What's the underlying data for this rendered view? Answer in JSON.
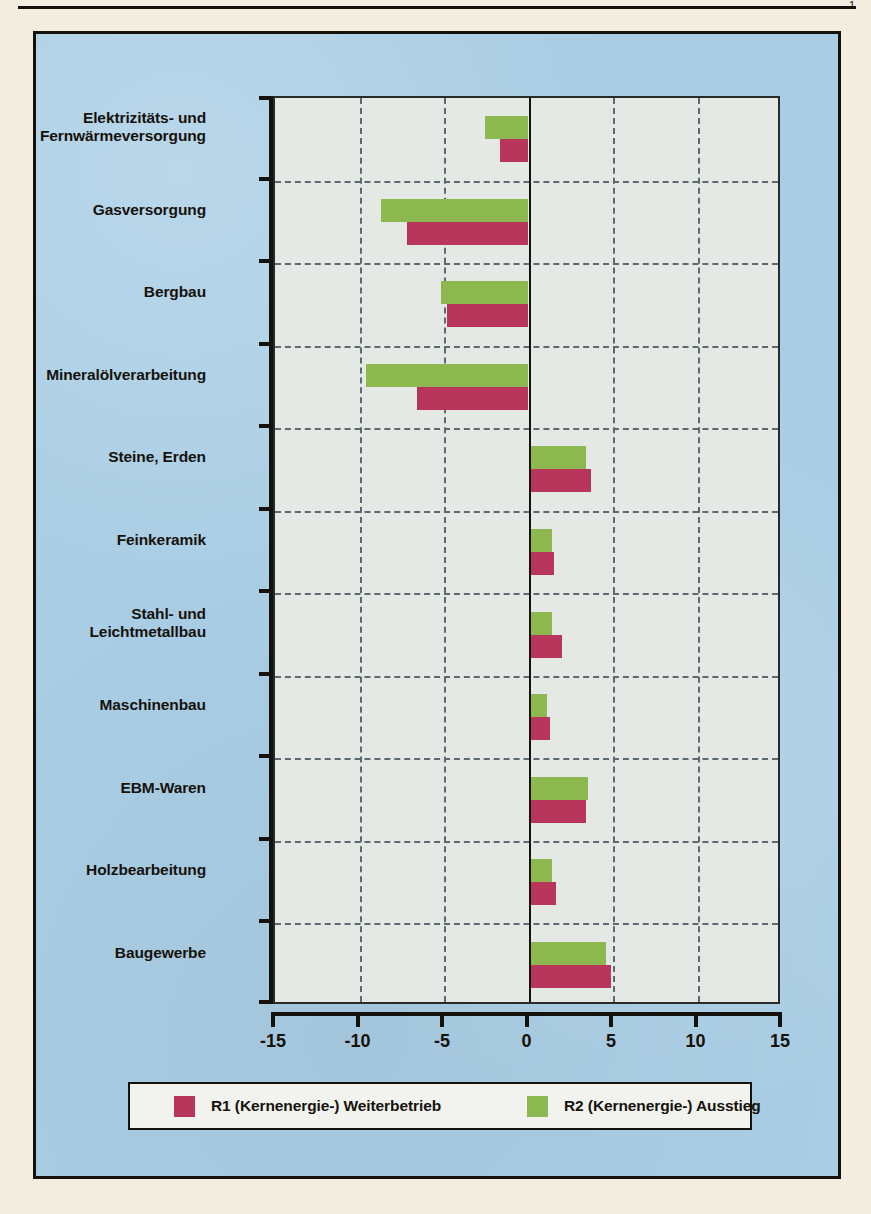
{
  "page": {
    "corner_mark": "1"
  },
  "colors": {
    "r1": "#b8365c",
    "r2": "#8cb84f",
    "panel_background": "#a9cde4",
    "plot_background": "#e4e9e6",
    "page_background": "#f3ede0",
    "ink": "#15120d",
    "gridline": "#5d6a72"
  },
  "legend": {
    "entries": [
      {
        "label": "R1 (Kernenergie-) Weiterbetrieb",
        "color": "#b8365c",
        "series": "R1"
      },
      {
        "label": "R2 (Kernenergie-) Ausstieg",
        "color": "#8cb84f",
        "series": "R2"
      }
    ]
  },
  "chart_data": {
    "type": "bar",
    "orientation": "horizontal",
    "title": "",
    "subtitle": "",
    "xlabel": "",
    "ylabel": "",
    "xlim": [
      -15,
      15
    ],
    "xticks": [
      -15,
      -10,
      -5,
      0,
      5,
      10,
      15
    ],
    "xtick_labels": [
      "-15",
      "-10",
      "-5",
      "0",
      "5",
      "10",
      "15"
    ],
    "grid": true,
    "grid_style": "dashed",
    "legend_position": "bottom",
    "categories": [
      "Elektrizitäts- und\nFernwärmeversorgung",
      "Gasversorgung",
      "Bergbau",
      "Mineralölverarbeitung",
      "Steine, Erden",
      "Feinkeramik",
      "Stahl- und\nLeichtmetallbau",
      "Maschinenbau",
      "EBM-Waren",
      "Holzbearbeitung",
      "Baugewerbe"
    ],
    "category_lines": [
      [
        "Elektrizitäts- und",
        "Fernwärmeversorgung"
      ],
      [
        "Gasversorgung"
      ],
      [
        "Bergbau"
      ],
      [
        "Mineralölverarbeitung"
      ],
      [
        "Steine, Erden"
      ],
      [
        "Feinkeramik"
      ],
      [
        "Stahl- und",
        "Leichtmetallbau"
      ],
      [
        "Maschinenbau"
      ],
      [
        "EBM-Waren"
      ],
      [
        "Holzbearbeitung"
      ],
      [
        "Baugewerbe"
      ]
    ],
    "series": [
      {
        "name": "R1 (Kernenergie-) Weiterbetrieb",
        "color": "#b8365c",
        "values": [
          -1.7,
          -7.2,
          -4.8,
          -6.6,
          3.7,
          1.5,
          2.0,
          1.3,
          3.4,
          1.6,
          4.9
        ]
      },
      {
        "name": "R2 (Kernenergie-) Ausstieg",
        "color": "#8cb84f",
        "values": [
          -2.6,
          -8.7,
          -5.2,
          -9.6,
          3.4,
          1.4,
          1.4,
          1.1,
          3.5,
          1.4,
          4.6
        ]
      }
    ]
  }
}
